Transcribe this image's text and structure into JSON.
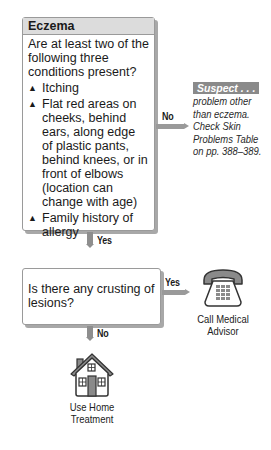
{
  "box1": {
    "title": "Eczema",
    "question": "Are at least two of the following three conditions present?",
    "bullets": [
      "Itching",
      "Flat red areas on cheeks, behind ears, along edge of plastic pants, behind knees, or in front of elbows (location can change with age)",
      "Family history of allergy"
    ],
    "bullet_symbol": "▲"
  },
  "branch1": {
    "no_label": "No",
    "yes_label": "Yes"
  },
  "suspect": {
    "tag": "Suspect . . .",
    "text": "problem other than eczema. Check Skin Problems Table on pp. 388–389."
  },
  "box2": {
    "question": "Is there any crusting of lesions?"
  },
  "branch2": {
    "yes_label": "Yes",
    "no_label": "No"
  },
  "outcomes": {
    "call": {
      "icon": "telephone-icon",
      "label_line1": "Call Medical",
      "label_line2": "Advisor"
    },
    "home": {
      "icon": "house-icon",
      "label_line1": "Use Home",
      "label_line2": "Treatment"
    }
  },
  "colors": {
    "header_bg": "#dcdcdc",
    "arrow": "#8e8e8e",
    "tag_bg": "#8a8a8a"
  }
}
